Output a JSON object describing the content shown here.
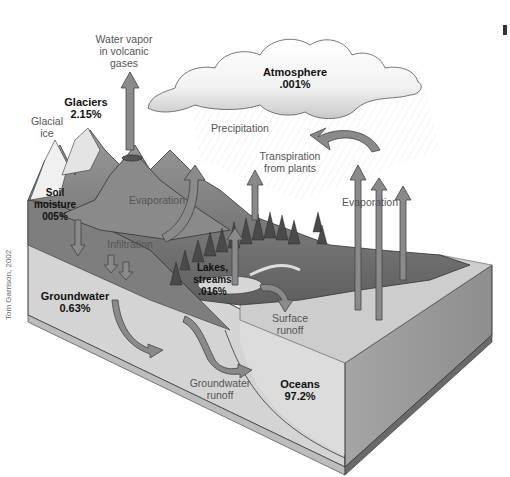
{
  "diagram": {
    "reservoirs": {
      "atmosphere": {
        "name": "Atmosphere",
        "percent": ".001%"
      },
      "glaciers": {
        "name": "Glaciers",
        "percent": "2.15%"
      },
      "soil_moisture": {
        "name_line1": "Soil",
        "name_line2": "moisture",
        "percent": "005%"
      },
      "lakes_streams": {
        "name_line1": "Lakes,",
        "name_line2": "streams",
        "percent": ".016%"
      },
      "groundwater": {
        "name": "Groundwater",
        "percent": "0.63%"
      },
      "oceans": {
        "name": "Oceans",
        "percent": "97.2%"
      }
    },
    "processes": {
      "volcanic_vapor": {
        "line1": "Water vapor",
        "line2": "in volcanic",
        "line3": "gases"
      },
      "glacial_ice": {
        "line1": "Glacial",
        "line2": "ice"
      },
      "precipitation": "Precipitation",
      "transpiration": {
        "line1": "Transpiration",
        "line2": "from plants"
      },
      "evaporation_land": "Evaporation",
      "evaporation_ocean": "Evaporation",
      "infiltration": "Infiltration",
      "surface_runoff": {
        "line1": "Surface",
        "line2": "runoff"
      },
      "groundwater_runoff": {
        "line1": "Groundwater",
        "line2": "runoff"
      }
    },
    "credit": "Tom Garrison, 2002",
    "colors": {
      "arrow_fill": "#8a8a8a",
      "arrow_stroke": "#444444",
      "land_dark": "#6e6e6e",
      "soil_layer": "#7a7a7a",
      "groundwater_layer": "#d2d2d2",
      "ocean_top": "#cfcfcf",
      "ocean_side": "#9a9a9a",
      "cloud": "#f4f4f4"
    }
  }
}
